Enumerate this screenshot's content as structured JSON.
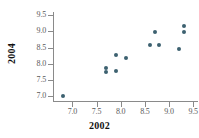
{
  "chart_data": {
    "type": "scatter",
    "title": "",
    "xlabel": "2002",
    "ylabel": "2004",
    "xlim": [
      6.6,
      9.6
    ],
    "ylim": [
      6.85,
      9.6
    ],
    "grid": false,
    "legend": null,
    "point_color": "#3d6170",
    "axis_color": "#8a8a8a",
    "xticks": [
      "7.0",
      "7.5",
      "8.0",
      "8.5",
      "9.0",
      "9.5"
    ],
    "xtick_values": [
      7.0,
      7.5,
      8.0,
      8.5,
      9.0,
      9.5
    ],
    "yticks": [
      "7.0",
      "7.5",
      "8.0",
      "8.5",
      "9.0",
      "9.5"
    ],
    "ytick_values": [
      7.0,
      7.5,
      8.0,
      8.5,
      9.0,
      9.5
    ],
    "x": [
      6.8,
      7.7,
      7.7,
      7.9,
      7.9,
      8.1,
      8.6,
      8.7,
      8.8,
      9.2,
      9.3,
      9.3
    ],
    "y": [
      7.0,
      7.87,
      7.76,
      8.28,
      7.78,
      8.17,
      8.57,
      8.97,
      8.57,
      8.47,
      9.17,
      8.97
    ],
    "points": [
      {
        "x": 6.8,
        "y": 7.0
      },
      {
        "x": 7.7,
        "y": 7.87
      },
      {
        "x": 7.7,
        "y": 7.76
      },
      {
        "x": 7.9,
        "y": 8.28
      },
      {
        "x": 7.9,
        "y": 7.78
      },
      {
        "x": 8.1,
        "y": 8.17
      },
      {
        "x": 8.6,
        "y": 8.57
      },
      {
        "x": 8.7,
        "y": 8.97
      },
      {
        "x": 8.8,
        "y": 8.57
      },
      {
        "x": 9.2,
        "y": 8.47
      },
      {
        "x": 9.3,
        "y": 9.17
      },
      {
        "x": 9.3,
        "y": 8.97
      }
    ],
    "n_points": 12
  }
}
